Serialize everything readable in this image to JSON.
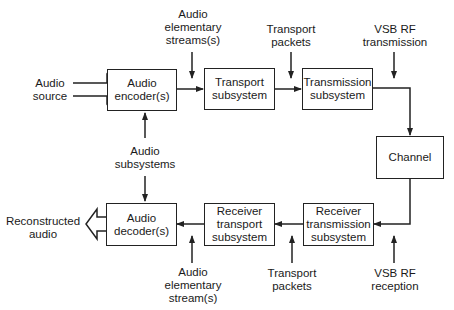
{
  "diagram": {
    "blocks": {
      "audio_encoder": "Audio\nencoder(s)",
      "transport_subsystem": "Transport\nsubsystem",
      "transmission_subsystem": "Transmission\nsubsystem",
      "channel": "Channel",
      "receiver_transmission_subsystem": "Receiver\ntransmission\nsubsystem",
      "receiver_transport_subsystem": "Receiver\ntransport\nsubsystem",
      "audio_decoder": "Audio\ndecoder(s)"
    },
    "labels": {
      "audio_source": "Audio\nsource",
      "audio_elementary_streams_top": "Audio\nelementary\nstreams(s)",
      "transport_packets_top": "Transport\npackets",
      "vsb_rf_transmission": "VSB RF\ntransmission",
      "audio_subsystems": "Audio\nsubsystems",
      "reconstructed_audio": "Reconstructed\naudio",
      "audio_elementary_stream_bottom": "Audio\nelementary\nstream(s)",
      "transport_packets_bottom": "Transport\npackets",
      "vsb_rf_reception": "VSB RF\nreception"
    },
    "colors": {
      "line": "#222222",
      "background": "#ffffff"
    }
  }
}
